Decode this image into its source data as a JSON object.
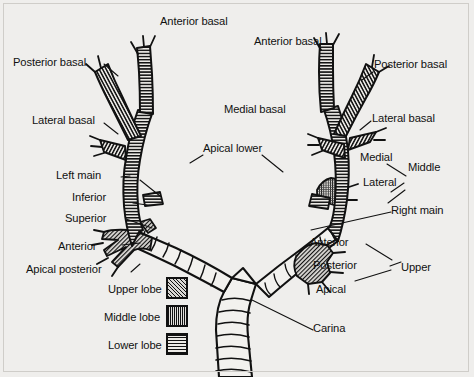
{
  "figure": {
    "background_color": "#efeeec",
    "ink_color": "#111111",
    "frame_color": "#cfcdc9"
  },
  "labels": {
    "left_lung": {
      "anterior_basal": "Anterior basal",
      "posterior_basal": "Posterior basal",
      "lateral_basal": "Lateral basal",
      "left_main": "Left main",
      "inferior": "Inferior",
      "superior": "Superior",
      "anterior": "Anterior",
      "apical_posterior": "Apical posterior"
    },
    "center": {
      "apical_lower": "Apical lower",
      "carina": "Carina"
    },
    "right_lung": {
      "anterior_basal": "Anterior basal",
      "posterior_basal": "Posterior basal",
      "medial_basal": "Medial basal",
      "lateral_basal": "Lateral basal",
      "medial": "Medial",
      "lateral": "Lateral",
      "middle": "Middle",
      "right_main": "Right main",
      "anterior": "Anterior",
      "posterior": "Posterior",
      "apical": "Apical",
      "upper": "Upper"
    }
  },
  "legend": {
    "items": [
      {
        "label": "Upper lobe",
        "pattern": "diagonal-hatch"
      },
      {
        "label": "Middle lobe",
        "pattern": "cross-hatch-fine"
      },
      {
        "label": "Lower lobe",
        "pattern": "horizontal-lines"
      }
    ]
  }
}
